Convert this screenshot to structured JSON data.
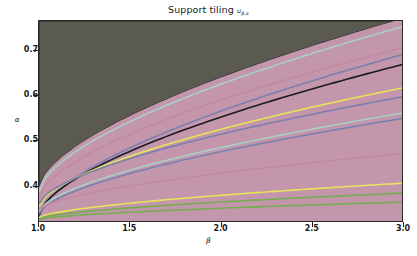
{
  "figure": {
    "title_main": "Support tiling",
    "title_symbol": "u",
    "title_subscript": "β,α",
    "background_color": "#ffffff"
  },
  "axes": {
    "xlabel": "β",
    "ylabel": "α",
    "xticks": [
      "1.0",
      "1.5",
      "2.0",
      "2.5",
      "3.0"
    ],
    "yticks": [
      "0.4",
      "0.5",
      "0.6",
      "0.7"
    ],
    "xlim": [
      1.0,
      3.0
    ],
    "ylim": [
      0.32,
      0.765
    ]
  },
  "chart_data": {
    "type": "heatmap",
    "xlabel": "β",
    "ylabel": "α",
    "x": [
      1.0,
      1.5,
      2.0,
      2.5,
      3.0
    ],
    "xlim": [
      1.0,
      3.0
    ],
    "ylim": [
      0.32,
      0.765
    ],
    "xticks": [
      1.0,
      1.5,
      2.0,
      2.5,
      3.0
    ],
    "yticks": [
      0.4,
      0.5,
      0.6,
      0.7
    ],
    "grid": false,
    "legend": "none",
    "palette": {
      "background_region": "#5a5a51",
      "salmon": "#f28a6a",
      "slate_purple": "#7b7fae",
      "dusty_rose": "#c28a9e",
      "pale_teal": "#a9cfc6",
      "yellow": "#e8e45a",
      "green": "#76ac52",
      "mauve": "#c396ab",
      "dark_edge": "#1a1a22"
    },
    "bands": [
      {
        "id": 1,
        "color": "#5a5a51",
        "name": "dark-olive-upper-left",
        "y0_at_x1": 0.765,
        "y1_at_x3": 0.765
      },
      {
        "id": 2,
        "color": "#7b7fae",
        "name": "slate-band-a",
        "y0_at_x1": 0.395,
        "y1_at_x3": 0.77
      },
      {
        "id": 3,
        "color": "#a9cfc6",
        "name": "teal-band-a",
        "y0_at_x1": 0.388,
        "y1_at_x3": 0.745
      },
      {
        "id": 4,
        "color": "#c28a9e",
        "name": "rose-band-a",
        "y0_at_x1": 0.383,
        "y1_at_x3": 0.72
      },
      {
        "id": 5,
        "color": "#7b7fae",
        "name": "slate-band-b",
        "y0_at_x1": 0.376,
        "y1_at_x3": 0.7
      },
      {
        "id": 6,
        "color": "#c28a9e",
        "name": "rose-band-b",
        "y0_at_x1": 0.37,
        "y1_at_x3": 0.68
      },
      {
        "id": 7,
        "color": "#f28a6a",
        "name": "salmon-band-a",
        "y0_at_x1": 0.362,
        "y1_at_x3": 0.625
      },
      {
        "id": 8,
        "color": "#e8e45a",
        "name": "yellow-band-a",
        "y0_at_x1": 0.356,
        "y1_at_x3": 0.612
      },
      {
        "id": 9,
        "color": "#7b7fae",
        "name": "slate-band-c",
        "y0_at_x1": 0.352,
        "y1_at_x3": 0.598
      },
      {
        "id": 10,
        "color": "#a9cfc6",
        "name": "teal-band-b",
        "y0_at_x1": 0.347,
        "y1_at_x3": 0.578
      },
      {
        "id": 11,
        "color": "#c28a9e",
        "name": "rose-band-c",
        "y0_at_x1": 0.343,
        "y1_at_x3": 0.558
      },
      {
        "id": 12,
        "color": "#7b7fae",
        "name": "slate-band-d",
        "y0_at_x1": 0.339,
        "y1_at_x3": 0.545
      },
      {
        "id": 13,
        "color": "#f28a6a",
        "name": "salmon-band-b",
        "y0_at_x1": 0.334,
        "y1_at_x3": 0.44
      },
      {
        "id": 14,
        "color": "#c396ab",
        "name": "mauve-band-a",
        "y0_at_x1": 0.33,
        "y1_at_x3": 0.418
      },
      {
        "id": 15,
        "color": "#e8e45a",
        "name": "yellow-band-b",
        "y0_at_x1": 0.327,
        "y1_at_x3": 0.4
      },
      {
        "id": 16,
        "color": "#76ac52",
        "name": "green-band-a",
        "y0_at_x1": 0.324,
        "y1_at_x3": 0.372
      },
      {
        "id": 17,
        "color": "#76ac52",
        "name": "green-band-b",
        "y0_at_x1": 0.322,
        "y1_at_x3": 0.352
      },
      {
        "id": 18,
        "color": "#c396ab",
        "name": "mauve-band-b",
        "y0_at_x1": 0.32,
        "y1_at_x3": 0.335
      }
    ]
  }
}
